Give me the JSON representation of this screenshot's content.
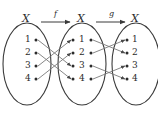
{
  "figure": {
    "title_alt": "Composition of functions diagram: X --f--> X --g--> X",
    "stroke_color": "#3a3a3a",
    "line_color": "#6b6b6b",
    "text_color": "#2b2b2b",
    "background": "#ffffff",
    "sets": [
      {
        "id": "left",
        "label": "X",
        "elements": [
          "1",
          "2",
          "3",
          "4"
        ]
      },
      {
        "id": "middle",
        "label": "X",
        "elements": [
          "1",
          "2",
          "3",
          "4"
        ]
      },
      {
        "id": "right",
        "label": "X",
        "elements": [
          "1",
          "2",
          "3",
          "4"
        ]
      }
    ],
    "maps": [
      {
        "id": "f",
        "label": "f",
        "from": "left",
        "to": "middle",
        "pairs": [
          {
            "from": "1",
            "to": "3"
          },
          {
            "from": "2",
            "to": "4"
          },
          {
            "from": "3",
            "to": "1"
          },
          {
            "from": "4",
            "to": "2"
          }
        ]
      },
      {
        "id": "g",
        "label": "g",
        "from": "middle",
        "to": "right",
        "pairs": [
          {
            "from": "1",
            "to": "2"
          },
          {
            "from": "2",
            "to": "1"
          },
          {
            "from": "3",
            "to": "4"
          },
          {
            "from": "4",
            "to": "3"
          }
        ]
      }
    ]
  }
}
